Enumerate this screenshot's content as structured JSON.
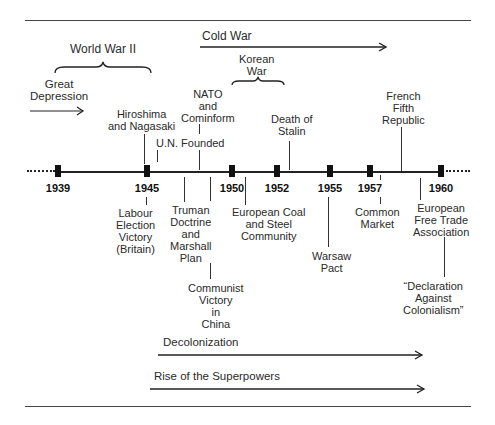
{
  "timeline": {
    "start_year": "1939",
    "end_year": "1960",
    "ticks": [
      {
        "year": "1939",
        "x": 58
      },
      {
        "year": "1945",
        "x": 147
      },
      {
        "year": "1950",
        "x": 232
      },
      {
        "year": "1952",
        "x": 277
      },
      {
        "year": "1955",
        "x": 330
      },
      {
        "year": "1957",
        "x": 370
      },
      {
        "year": "1960",
        "x": 441
      }
    ]
  },
  "periods": {
    "world_war_ii": "World War II",
    "great_depression": "Great\nDepression",
    "cold_war": "Cold War",
    "korean_war": "Korean\nWar",
    "decolonization": "Decolonization",
    "rise_of_superpowers": "Rise of the Superpowers"
  },
  "events_above": {
    "hiroshima": "Hiroshima\nand Nagasaki",
    "un_founded": "U.N. Founded",
    "nato": "NATO\nand\nCominform",
    "death_of_stalin": "Death of\nStalin",
    "french_fifth_republic": "French\nFifth\nRepublic"
  },
  "events_below": {
    "labour_election": "Labour\nElection\nVictory\n(Britain)",
    "truman_doctrine": "Truman\nDoctrine\nand\nMarshall\nPlan",
    "communist_victory": "Communist\nVictory\nin\nChina",
    "ecsc": "European Coal\nand Steel\nCommunity",
    "warsaw_pact": "Warsaw\nPact",
    "common_market": "Common\nMarket",
    "efta": "European\nFree Trade\nAssociation",
    "declaration": "“Declaration\nAgainst\nColonialism”"
  }
}
